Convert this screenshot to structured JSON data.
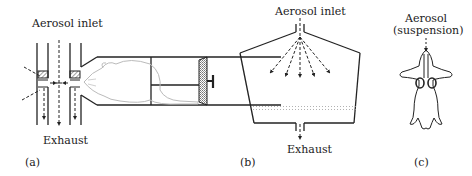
{
  "panel_a": {
    "caption": "(a)",
    "inlet_label": "Aerosol inlet",
    "exhaust_label": "Exhaust",
    "description": "Nose-only exposure tube: animal restrained in cylindrical holder with plunger, snout at central aerosol manifold"
  },
  "panel_b": {
    "caption": "(b)",
    "inlet_label": "Aerosol inlet",
    "exhaust_label": "Exhaust",
    "description": "Whole-body exposure chamber with diffusing inlet arrows and floor of animals"
  },
  "panel_c": {
    "caption": "(c)",
    "label_line1": "Aerosol",
    "label_line2": "(suspension)",
    "description": "Intratracheal instillation into supine animal, lungs shown"
  },
  "colors": {
    "line": "#222222",
    "hatch": "#555555",
    "mouse": "#bbbbbb",
    "dots": "#999999"
  }
}
